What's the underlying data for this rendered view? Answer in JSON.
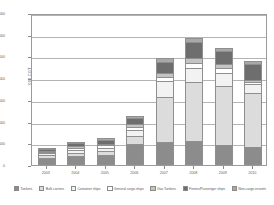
{
  "chart_data": {
    "type": "bar",
    "stacked": true,
    "title": "",
    "xlabel": "",
    "ylabel": "'000 CGT",
    "ylim": [
      0,
      70000
    ],
    "ytick_values": [
      0,
      10000,
      20000,
      30000,
      40000,
      50000,
      60000,
      70000
    ],
    "ytick_labels": [
      "0",
      "10,000",
      "20,000",
      "30,000",
      "40,000",
      "50,000",
      "60,000",
      "70,000"
    ],
    "grid": true,
    "legend_position": "bottom",
    "categories": [
      "2003",
      "2004",
      "2005",
      "2006",
      "2007",
      "2008",
      "2009",
      "2010"
    ],
    "series": [
      {
        "name": "Tankers",
        "color": "#8c8c8c",
        "values": [
          3100,
          4000,
          4800,
          9700,
          10800,
          11200,
          9400,
          8400
        ]
      },
      {
        "name": "Bulk carriers",
        "color": "#dcdcdc",
        "values": [
          1400,
          1500,
          1700,
          3600,
          20300,
          26900,
          26800,
          24600
        ]
      },
      {
        "name": "Container ships",
        "color": "#f2f2f2",
        "values": [
          900,
          1400,
          1500,
          2900,
          7400,
          6400,
          6100,
          4100
        ]
      },
      {
        "name": "General cargo ships",
        "color": "#ffffff",
        "values": [
          600,
          900,
          1000,
          1500,
          2200,
          2700,
          2500,
          1300
        ]
      },
      {
        "name": "Gas Tankers",
        "color": "#c4c4c4",
        "values": [
          500,
          800,
          900,
          1200,
          1900,
          2300,
          1700,
          900
        ]
      },
      {
        "name": "Ferries/Passenger ships",
        "color": "#6e6e6e",
        "values": [
          1000,
          1600,
          1800,
          2700,
          5000,
          7200,
          5900,
          7300
        ]
      },
      {
        "name": "Non-cargo vessels",
        "color": "#a8a8a8",
        "values": [
          400,
          600,
          700,
          1100,
          1700,
          2000,
          1400,
          1100
        ]
      }
    ]
  }
}
